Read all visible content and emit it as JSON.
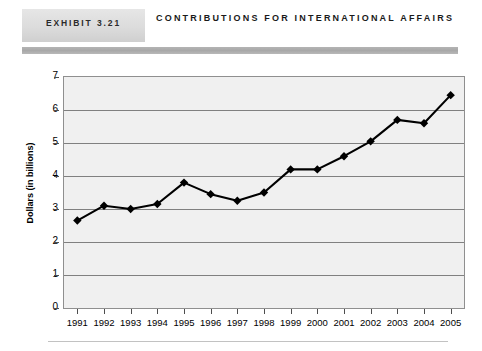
{
  "header": {
    "exhibit_label": "EXHIBIT 3.21",
    "title": "CONTRIBUTIONS FOR INTERNATIONAL AFFAIRS"
  },
  "colors": {
    "exhibit_box": "#dcdcdc",
    "header_rule": "#a8a8a8",
    "plot_background": "#f0f0f0",
    "gridline": "#808080",
    "series_line": "#000000",
    "marker": "#000000"
  },
  "chart_data": {
    "type": "line",
    "title": "CONTRIBUTIONS FOR INTERNATIONAL AFFAIRS",
    "xlabel": "",
    "ylabel": "Dollars (in billions)",
    "ylim": [
      0,
      7
    ],
    "yticks": [
      0,
      1,
      2,
      3,
      4,
      5,
      6,
      7
    ],
    "grid": "horizontal",
    "legend": "none",
    "marker": "diamond",
    "categories": [
      "1991",
      "1992",
      "1993",
      "1994",
      "1995",
      "1996",
      "1997",
      "1998",
      "1999",
      "2000",
      "2001",
      "2002",
      "2003",
      "2004",
      "2005"
    ],
    "values": [
      2.65,
      3.1,
      3.0,
      3.15,
      3.8,
      3.45,
      3.25,
      3.5,
      4.2,
      4.2,
      4.6,
      5.05,
      5.7,
      5.6,
      6.45
    ]
  }
}
